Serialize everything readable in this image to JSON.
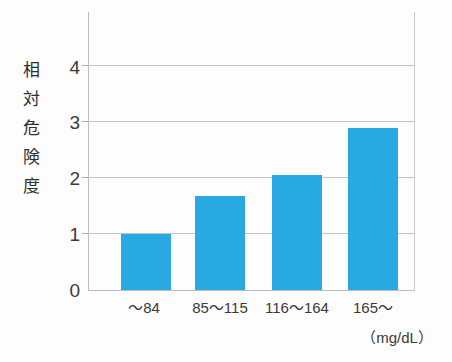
{
  "chart_data": {
    "type": "bar",
    "title": "",
    "subtitle": "",
    "categories": [
      "〜84",
      "85〜115",
      "116〜164",
      "165〜"
    ],
    "values": [
      1.0,
      1.67,
      2.05,
      2.9
    ],
    "series": [
      {
        "name": "相対危険度",
        "values": [
          1.0,
          1.67,
          2.05,
          2.9
        ]
      }
    ],
    "xlabel": "",
    "ylabel": "相対危険度",
    "x_unit": "（mg/dL）",
    "ylim": [
      0,
      4.8
    ],
    "yticks": [
      0,
      1,
      2,
      3,
      4
    ],
    "ytick_labels": [
      "0",
      "1",
      "2",
      "3",
      "4"
    ],
    "grid": "horizontal",
    "legend": "none",
    "bar_color": "#29a9e2",
    "gridline_color": "#c4c4c4",
    "axis_color": "#bdbdbd",
    "background_color": "#fdfdfd",
    "annotations": []
  },
  "axes": {
    "y_title": "相\n対\n危\n険\n度",
    "y_tick_labels": [
      "4",
      "3",
      "2",
      "1",
      "0"
    ],
    "x_tick_labels": [
      "〜84",
      "85〜115",
      "116〜164",
      "165〜"
    ],
    "x_unit_label": "（mg/dL）"
  }
}
